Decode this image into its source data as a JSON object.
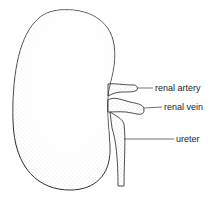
{
  "diagram": {
    "labels": [
      {
        "id": "renal-artery",
        "text": "renal artery"
      },
      {
        "id": "renal-vein",
        "text": "renal vein"
      },
      {
        "id": "ureter",
        "text": "ureter"
      }
    ]
  }
}
